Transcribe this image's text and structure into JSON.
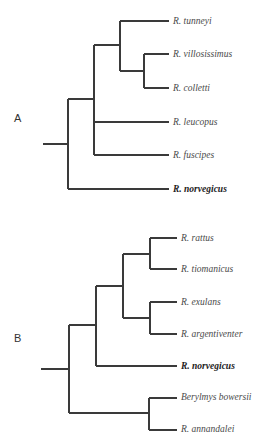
{
  "figure": {
    "panels": [
      {
        "id": "A",
        "label": "A",
        "label_pos": [
          14,
          118
        ],
        "taxa": [
          {
            "name": "R. tunneyi",
            "y": 21,
            "x": 173,
            "bold": false
          },
          {
            "name": "R. villosissimus",
            "y": 54,
            "x": 173,
            "bold": false
          },
          {
            "name": "R. colletti",
            "y": 88,
            "x": 173,
            "bold": false
          },
          {
            "name": "R. leucopus",
            "y": 122,
            "x": 173,
            "bold": false
          },
          {
            "name": "R. fuscipes",
            "y": 155,
            "x": 173,
            "bold": false
          },
          {
            "name": "R. norvegicus",
            "y": 189,
            "x": 173,
            "bold": true
          }
        ],
        "branches": [
          [
            43,
            144,
            68,
            144
          ],
          [
            68,
            99,
            68,
            189
          ],
          [
            68,
            189,
            169,
            189
          ],
          [
            68,
            99,
            94,
            99
          ],
          [
            94,
            45,
            94,
            155
          ],
          [
            94,
            122,
            169,
            122
          ],
          [
            94,
            155,
            169,
            155
          ],
          [
            94,
            45,
            120,
            45
          ],
          [
            120,
            21,
            120,
            71
          ],
          [
            120,
            21,
            169,
            21
          ],
          [
            120,
            71,
            144,
            71
          ],
          [
            144,
            54,
            144,
            88
          ],
          [
            144,
            54,
            169,
            54
          ],
          [
            144,
            88,
            169,
            88
          ]
        ]
      },
      {
        "id": "B",
        "label": "B",
        "label_pos": [
          14,
          338
        ],
        "taxa": [
          {
            "name": "R. rattus",
            "y": 238,
            "x": 181,
            "bold": false
          },
          {
            "name": "R. tiomanicus",
            "y": 269,
            "x": 181,
            "bold": false
          },
          {
            "name": "R. exulans",
            "y": 302,
            "x": 181,
            "bold": false
          },
          {
            "name": "R. argentiventer",
            "y": 334,
            "x": 181,
            "bold": false
          },
          {
            "name": "R. norvegicus",
            "y": 366,
            "x": 181,
            "bold": true
          },
          {
            "name": "Berylmys bowersii",
            "y": 397,
            "x": 181,
            "bold": false
          },
          {
            "name": "R. annandalei",
            "y": 429,
            "x": 181,
            "bold": false
          }
        ],
        "branches": [
          [
            41,
            369,
            69,
            369
          ],
          [
            69,
            325,
            69,
            413
          ],
          [
            69,
            325,
            96,
            325
          ],
          [
            69,
            413,
            149,
            413
          ],
          [
            96,
            286,
            96,
            366
          ],
          [
            96,
            366,
            177,
            366
          ],
          [
            96,
            286,
            123,
            286
          ],
          [
            123,
            254,
            123,
            318
          ],
          [
            123,
            254,
            150,
            254
          ],
          [
            123,
            318,
            150,
            318
          ],
          [
            150,
            238,
            150,
            269
          ],
          [
            150,
            238,
            177,
            238
          ],
          [
            150,
            269,
            177,
            269
          ],
          [
            150,
            302,
            150,
            334
          ],
          [
            150,
            302,
            177,
            302
          ],
          [
            150,
            334,
            177,
            334
          ],
          [
            149,
            398,
            149,
            430
          ],
          [
            149,
            398,
            177,
            398
          ],
          [
            149,
            430,
            177,
            430
          ]
        ]
      }
    ],
    "colors": {
      "branch": "#3a3a3a",
      "taxon_text": "#4a4a4a",
      "highlight_text": "#222222",
      "background": "#ffffff"
    }
  }
}
